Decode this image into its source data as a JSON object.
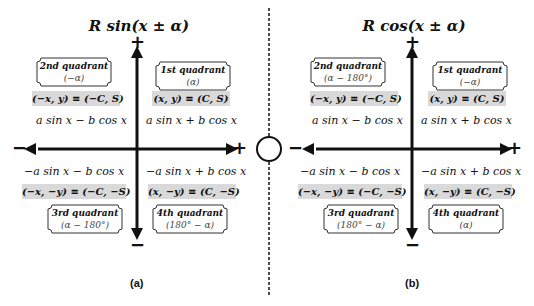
{
  "panels": [
    {
      "title": "R sin(x ± α)",
      "caption": "(a)",
      "quadrants": {
        "q1": {
          "name": "1st quadrant",
          "angle": "(α)",
          "coord": "(x, y) ≡ (C, S)",
          "expr": "a sin x + b cos x"
        },
        "q2": {
          "name": "2nd quadrant",
          "angle": "(−α)",
          "coord": "(−x, y) ≡ (−C, S)",
          "expr": "a sin x − b cos x"
        },
        "q3": {
          "name": "3rd quadrant",
          "angle": "(α − 180°)",
          "coord": "(−x, −y) ≡ (−C, −S)",
          "expr": "−a sin x − b cos x"
        },
        "q4": {
          "name": "4th quadrant",
          "angle": "(180° − α)",
          "coord": "(x, −y) ≡ (C, −S)",
          "expr": "−a sin x + b cos x"
        }
      }
    },
    {
      "title": "R cos(x ± α)",
      "caption": "(b)",
      "quadrants": {
        "q1": {
          "name": "1st quadrant",
          "angle": "(−α)",
          "coord": "(x, y) ≡ (C, S)",
          "expr": "a sin x + b cos x"
        },
        "q2": {
          "name": "2nd quadrant",
          "angle": "(α − 180°)",
          "coord": "(−x, y) ≡ (−C, S)",
          "expr": "a sin x − b cos x"
        },
        "q3": {
          "name": "3rd quadrant",
          "angle": "(180° − α)",
          "coord": "(−x, −y) ≡ (−C, −S)",
          "expr": "−a sin x − b cos x"
        },
        "q4": {
          "name": "4th quadrant",
          "angle": "(α)",
          "coord": "(x, −y) ≡ (C, −S)",
          "expr": "−a sin x + b cos x"
        }
      }
    }
  ],
  "axis_signs": {
    "plus": "+",
    "minus": "−"
  },
  "colors": {
    "coord_bg": "#d9d9d9",
    "line": "#111111"
  }
}
